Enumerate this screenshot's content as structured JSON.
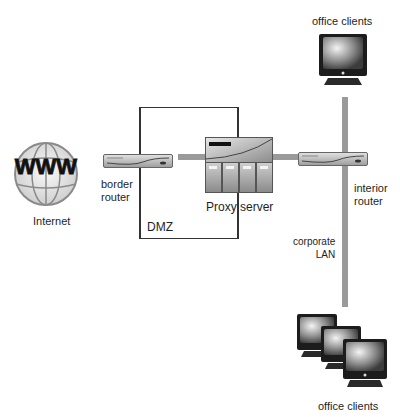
{
  "diagram": {
    "nodes": {
      "internet": {
        "label": "Internet",
        "icon": "www-globe-icon"
      },
      "border_router": {
        "label": "border\nrouter",
        "icon": "router-icon"
      },
      "proxy_server": {
        "label": "Proxy server",
        "icon": "server-icon"
      },
      "interior_router": {
        "label": "interior\nrouter",
        "icon": "router-icon"
      },
      "office_clients_top": {
        "label": "office clients",
        "icon": "monitor-icon"
      },
      "office_clients_bottom": {
        "label": "office clients",
        "icon": "monitor-group-icon"
      }
    },
    "zones": {
      "dmz": {
        "label": "DMZ"
      },
      "corporate_lan": {
        "label": "corporate\nLAN"
      }
    },
    "connections": [
      {
        "from": "border_router",
        "to": "proxy_server"
      },
      {
        "from": "proxy_server",
        "to": "interior_router"
      },
      {
        "from": "interior_router",
        "to": "corporate_lan"
      },
      {
        "from": "corporate_lan",
        "to": "office_clients_top"
      },
      {
        "from": "corporate_lan",
        "to": "office_clients_bottom"
      }
    ],
    "colors": {
      "line": "#9a9a9a",
      "box": "#333333"
    }
  }
}
